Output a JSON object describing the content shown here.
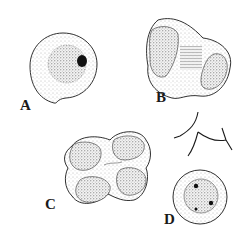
{
  "figure": {
    "panels": [
      {
        "id": "A",
        "label": "A",
        "description": "round cell with granular cytoplasm, central nucleus and dark nucleolus"
      },
      {
        "id": "B",
        "label": "B",
        "description": "dividing cell (dyad) with two dense halves and central striated region"
      },
      {
        "id": "C",
        "label": "C",
        "description": "tetrad of four granular lobes within common wall"
      },
      {
        "id": "D",
        "label": "D",
        "description": "round cell with nucleus and three dark bodies, with a branched three-armed filament above"
      }
    ],
    "colors": {
      "ink": "#1a1a1a",
      "stipple": "#555555",
      "background": "#ffffff"
    }
  }
}
